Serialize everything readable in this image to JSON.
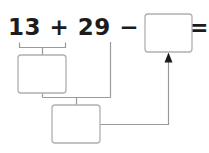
{
  "worksheet": {
    "equation": {
      "full_text": "13 + 29 − 15 =",
      "terms": {
        "first_addend": "13",
        "plus_sign": "+",
        "second_addend": "29",
        "minus_sign": "−",
        "subtrahend": "15",
        "equals_sign": "="
      }
    },
    "answer_boxes": [
      {
        "id": "box-partial-sum",
        "value": "",
        "placeholder": ""
      },
      {
        "id": "box-partial-difference",
        "value": "",
        "placeholder": ""
      },
      {
        "id": "box-final-answer",
        "value": "",
        "placeholder": ""
      }
    ],
    "connectors": {
      "brace_top_label": "",
      "arrow_label": ""
    },
    "colors": {
      "ink": "#1c1c1c",
      "line": "#9a9a9a",
      "box_border": "#b0b0b0",
      "box_fill": "#ffffff",
      "arrow_fill": "#1c1c1c",
      "page_background": "#ffffff"
    }
  }
}
